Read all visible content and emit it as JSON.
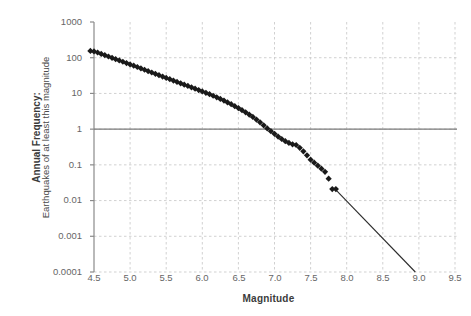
{
  "chart_data": {
    "type": "scatter",
    "title": "",
    "subtitle": "",
    "xlabel": "Magnitude",
    "ylabel_bold": "Annual Frequency:",
    "ylabel_regular": "Earthquakes of at least this magnitude",
    "xlim": [
      4.5,
      9.5
    ],
    "ylim": [
      0.0001,
      1000
    ],
    "yscale": "log",
    "xscale": "linear",
    "grid": true,
    "grid_style": "dashed",
    "grid_color": "#cccccc",
    "legend": "none",
    "marker": "diamond",
    "marker_color": "#1a1a1a",
    "xticks": [
      "4.5",
      "5.0",
      "5.5",
      "6.0",
      "6.5",
      "7.0",
      "7.5",
      "8.0",
      "8.5",
      "9.0",
      "9.5"
    ],
    "xtick_values": [
      4.5,
      5.0,
      5.5,
      6.0,
      6.5,
      7.0,
      7.5,
      8.0,
      8.5,
      9.0,
      9.5
    ],
    "yticks": [
      "1000",
      "100",
      "10",
      "1",
      "0.1",
      "0.01",
      "0.001",
      "0.0001"
    ],
    "ytick_values": [
      1000,
      100,
      10,
      1,
      0.1,
      0.01,
      0.001,
      0.0001
    ],
    "reference_line": {
      "name": "one-per-year-line",
      "y": 1,
      "x_from": 4.5,
      "x_to": 9.5,
      "color": "#7a7a7a",
      "style": "solid"
    },
    "extrapolation_line": {
      "name": "extrapolation-line",
      "points": [
        [
          7.85,
          0.02
        ],
        [
          8.95,
          0.0001
        ]
      ],
      "color": "#2b2b2b",
      "style": "solid"
    },
    "series": [
      {
        "name": "Cumulative annual frequency",
        "x": [
          4.45,
          4.5,
          4.55,
          4.6,
          4.65,
          4.7,
          4.75,
          4.8,
          4.85,
          4.9,
          4.95,
          5.0,
          5.05,
          5.1,
          5.15,
          5.2,
          5.25,
          5.3,
          5.35,
          5.4,
          5.45,
          5.5,
          5.55,
          5.6,
          5.65,
          5.7,
          5.75,
          5.8,
          5.85,
          5.9,
          5.95,
          6.0,
          6.05,
          6.1,
          6.15,
          6.2,
          6.25,
          6.3,
          6.35,
          6.4,
          6.45,
          6.5,
          6.55,
          6.6,
          6.65,
          6.7,
          6.75,
          6.8,
          6.85,
          6.9,
          6.95,
          7.0,
          7.05,
          7.1,
          7.15,
          7.2,
          7.25,
          7.3,
          7.35,
          7.4,
          7.45,
          7.5,
          7.55,
          7.6,
          7.65,
          7.7,
          7.75,
          7.8,
          7.85
        ],
        "values": [
          155,
          150,
          140,
          128,
          118,
          108,
          99,
          91,
          84,
          77,
          71,
          65,
          60,
          55,
          50,
          46,
          42,
          38.5,
          35.3,
          32.4,
          29.7,
          27.2,
          25.0,
          22.9,
          21.0,
          19.2,
          17.6,
          16.2,
          14.8,
          13.6,
          12.4,
          11.4,
          10.4,
          9.5,
          8.6,
          7.8,
          7.0,
          6.3,
          5.6,
          5.0,
          4.4,
          3.9,
          3.4,
          2.95,
          2.55,
          2.2,
          1.85,
          1.55,
          1.28,
          1.05,
          0.88,
          0.74,
          0.62,
          0.53,
          0.46,
          0.41,
          0.375,
          0.36,
          0.3,
          0.24,
          0.185,
          0.14,
          0.115,
          0.095,
          0.078,
          0.064,
          0.041,
          0.021,
          0.021
        ]
      }
    ]
  },
  "axes": {
    "x_title": "Magnitude",
    "y_title_bold": "Annual Frequency:",
    "y_title_regular": "Earthquakes of at least this magnitude"
  }
}
